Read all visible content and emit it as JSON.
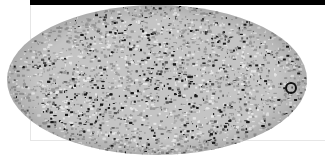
{
  "image": {
    "subject": "all-sky map in elliptical (Mollweide) projection",
    "palette": {
      "background": "#ffffff",
      "bar": "#000000",
      "frame": "#e6e6e6",
      "sky_light": "#d8d8d8",
      "sky_mid": "#a0a0a0",
      "sky_dark": "#141414"
    }
  }
}
